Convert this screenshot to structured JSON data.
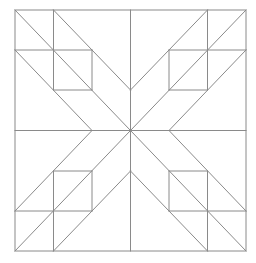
{
  "diagram": {
    "title": "",
    "type": "quilt-block-line-drawing",
    "canvas": {
      "width": 256,
      "height": 263,
      "background": "#ffffff"
    },
    "stroke": {
      "color": "#8a8a8a",
      "width": 1
    },
    "outer_square": {
      "x": 15,
      "y": 10,
      "width": 231,
      "height": 241
    },
    "grid": {
      "x": [
        15,
        53.5,
        92,
        130.5,
        169,
        207.5,
        246
      ],
      "y": [
        10,
        50,
        90,
        130.5,
        171,
        211,
        251
      ]
    },
    "lines": [
      {
        "name": "center-vertical",
        "x1": 130.5,
        "y1": 10,
        "x2": 130.5,
        "y2": 251
      },
      {
        "name": "center-horizontal",
        "x1": 15,
        "y1": 130.5,
        "x2": 246,
        "y2": 130.5
      },
      {
        "name": "tl-main-diagonal",
        "x1": 15,
        "y1": 10,
        "x2": 130.5,
        "y2": 130.5
      },
      {
        "name": "tl-upper-diagonal",
        "x1": 53.5,
        "y1": 10,
        "x2": 130.5,
        "y2": 90
      },
      {
        "name": "tl-lower-diagonal",
        "x1": 15,
        "y1": 50,
        "x2": 92,
        "y2": 130.5
      },
      {
        "name": "tl-vertical",
        "x1": 53.5,
        "y1": 10,
        "x2": 53.5,
        "y2": 90
      },
      {
        "name": "tl-horizontal",
        "x1": 15,
        "y1": 50,
        "x2": 92,
        "y2": 50
      },
      {
        "name": "tl-square-right",
        "x1": 92,
        "y1": 50,
        "x2": 92,
        "y2": 90
      },
      {
        "name": "tl-square-bottom",
        "x1": 53.5,
        "y1": 90,
        "x2": 92,
        "y2": 90
      },
      {
        "name": "tr-main-diagonal",
        "x1": 246,
        "y1": 10,
        "x2": 130.5,
        "y2": 130.5
      },
      {
        "name": "tr-upper-diagonal",
        "x1": 207.5,
        "y1": 10,
        "x2": 130.5,
        "y2": 90
      },
      {
        "name": "tr-lower-diagonal",
        "x1": 246,
        "y1": 50,
        "x2": 169,
        "y2": 130.5
      },
      {
        "name": "tr-vertical",
        "x1": 207.5,
        "y1": 10,
        "x2": 207.5,
        "y2": 90
      },
      {
        "name": "tr-horizontal",
        "x1": 169,
        "y1": 50,
        "x2": 246,
        "y2": 50
      },
      {
        "name": "tr-square-left",
        "x1": 169,
        "y1": 50,
        "x2": 169,
        "y2": 90
      },
      {
        "name": "tr-square-bottom",
        "x1": 169,
        "y1": 90,
        "x2": 207.5,
        "y2": 90
      },
      {
        "name": "bl-main-diagonal",
        "x1": 15,
        "y1": 251,
        "x2": 130.5,
        "y2": 130.5
      },
      {
        "name": "bl-lower-diagonal",
        "x1": 53.5,
        "y1": 251,
        "x2": 130.5,
        "y2": 171
      },
      {
        "name": "bl-upper-diagonal",
        "x1": 15,
        "y1": 211,
        "x2": 92,
        "y2": 130.5
      },
      {
        "name": "bl-vertical",
        "x1": 53.5,
        "y1": 171,
        "x2": 53.5,
        "y2": 251
      },
      {
        "name": "bl-horizontal",
        "x1": 15,
        "y1": 211,
        "x2": 92,
        "y2": 211
      },
      {
        "name": "bl-square-right",
        "x1": 92,
        "y1": 171,
        "x2": 92,
        "y2": 211
      },
      {
        "name": "bl-square-top",
        "x1": 53.5,
        "y1": 171,
        "x2": 92,
        "y2": 171
      },
      {
        "name": "br-main-diagonal",
        "x1": 246,
        "y1": 251,
        "x2": 130.5,
        "y2": 130.5
      },
      {
        "name": "br-lower-diagonal",
        "x1": 207.5,
        "y1": 251,
        "x2": 130.5,
        "y2": 171
      },
      {
        "name": "br-upper-diagonal",
        "x1": 246,
        "y1": 211,
        "x2": 169,
        "y2": 130.5
      },
      {
        "name": "br-vertical",
        "x1": 207.5,
        "y1": 171,
        "x2": 207.5,
        "y2": 251
      },
      {
        "name": "br-horizontal",
        "x1": 169,
        "y1": 211,
        "x2": 246,
        "y2": 211
      },
      {
        "name": "br-square-left",
        "x1": 169,
        "y1": 171,
        "x2": 169,
        "y2": 211
      },
      {
        "name": "br-square-top",
        "x1": 169,
        "y1": 171,
        "x2": 207.5,
        "y2": 171
      }
    ]
  }
}
